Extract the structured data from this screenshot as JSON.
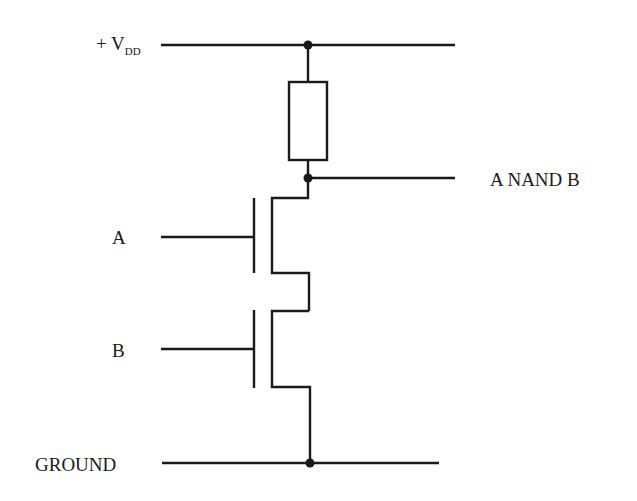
{
  "diagram": {
    "labels": {
      "vdd_prefix": "+ V",
      "vdd_subscript": "DD",
      "input_a": "A",
      "input_b": "B",
      "output": "A NAND B",
      "ground": "GROUND"
    },
    "components": [
      {
        "type": "resistor",
        "name": "pull-up-load",
        "from": "VDD",
        "to": "OUT"
      },
      {
        "type": "nmos-transistor",
        "name": "transistor-a",
        "gate": "A",
        "drain": "OUT",
        "source": "mid-node"
      },
      {
        "type": "nmos-transistor",
        "name": "transistor-b",
        "gate": "B",
        "drain": "mid-node",
        "source": "GROUND"
      }
    ],
    "nodes": [
      "VDD",
      "OUT",
      "GROUND"
    ],
    "colors": {
      "line": "#1a1a1a",
      "background": "#ffffff"
    }
  }
}
